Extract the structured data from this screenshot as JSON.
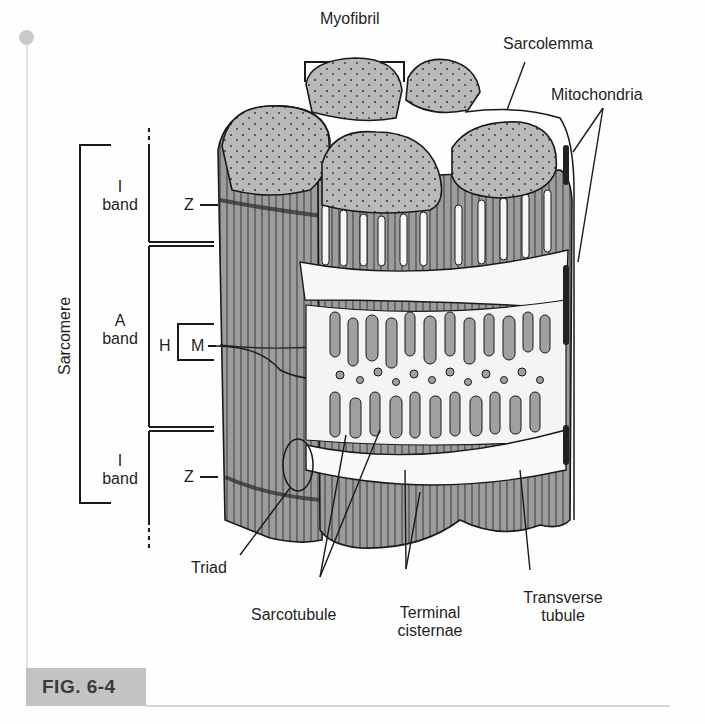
{
  "figure": {
    "label": "FIG. 6-4",
    "colors": {
      "fiber_fill": "#9a9a9a",
      "cap_fill": "#b8b8b8",
      "outline": "#1a1a1a",
      "tag_bg": "#c3c3c3",
      "tag_text": "#3a3a3a"
    }
  },
  "labels": {
    "myofibril": "Myofibril",
    "sarcolemma": "Sarcolemma",
    "mitochondria": "Mitochondria",
    "sarcomere": "Sarcomere",
    "i_band_top_1": "I",
    "i_band_top_2": "band",
    "a_band_1": "A",
    "a_band_2": "band",
    "i_band_bottom_1": "I",
    "i_band_bottom_2": "band",
    "z_top": "Z",
    "z_bottom": "Z",
    "h": "H",
    "m": "M",
    "triad": "Triad",
    "sarcotubule": "Sarcotubule",
    "terminal_cisternae_1": "Terminal",
    "terminal_cisternae_2": "cisternae",
    "transverse_tubule_1": "Transverse",
    "transverse_tubule_2": "tubule"
  }
}
